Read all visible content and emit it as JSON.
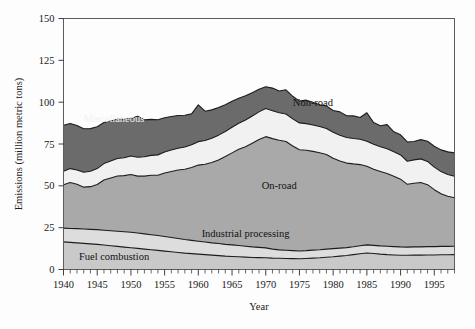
{
  "chart_data": {
    "type": "area",
    "stacked": true,
    "title": "",
    "xlabel": "Year",
    "ylabel": "Emissions (million metric tons)",
    "xlim": [
      1940,
      1998
    ],
    "ylim": [
      0,
      150
    ],
    "yticks": [
      0,
      25,
      50,
      75,
      100,
      125,
      150
    ],
    "xticks": [
      1940,
      1945,
      1950,
      1955,
      1960,
      1965,
      1970,
      1975,
      1980,
      1985,
      1990,
      1995
    ],
    "xtick_minor_step": 1,
    "grid": false,
    "legend": "inline-labels",
    "x": [
      1940,
      1941,
      1942,
      1943,
      1944,
      1945,
      1946,
      1947,
      1948,
      1949,
      1950,
      1951,
      1952,
      1953,
      1954,
      1955,
      1956,
      1957,
      1958,
      1959,
      1960,
      1961,
      1962,
      1963,
      1964,
      1965,
      1966,
      1967,
      1968,
      1969,
      1970,
      1971,
      1972,
      1973,
      1974,
      1975,
      1976,
      1977,
      1978,
      1979,
      1980,
      1981,
      1982,
      1983,
      1984,
      1985,
      1986,
      1987,
      1988,
      1989,
      1990,
      1991,
      1992,
      1993,
      1994,
      1995,
      1996,
      1997,
      1998
    ],
    "series": [
      {
        "name": "Fuel combustion",
        "color": "#c9c9c9",
        "values": [
          16.5,
          16.2,
          15.9,
          15.6,
          15.3,
          15.0,
          14.6,
          14.2,
          13.8,
          13.4,
          13.0,
          12.6,
          12.2,
          11.8,
          11.4,
          11.0,
          10.6,
          10.2,
          9.8,
          9.5,
          9.2,
          8.9,
          8.6,
          8.3,
          8.0,
          7.8,
          7.6,
          7.4,
          7.2,
          7.1,
          7.0,
          6.8,
          6.7,
          6.6,
          6.5,
          6.4,
          6.6,
          6.8,
          7.0,
          7.3,
          7.6,
          8.0,
          8.4,
          8.9,
          9.4,
          9.9,
          9.6,
          9.2,
          8.9,
          8.7,
          8.5,
          8.5,
          8.6,
          8.6,
          8.7,
          8.7,
          8.8,
          8.8,
          8.9
        ]
      },
      {
        "name": "Industrial processing",
        "color": "#dddddd",
        "values": [
          8.2,
          8.3,
          8.5,
          8.6,
          8.7,
          8.8,
          8.9,
          9.0,
          9.1,
          9.2,
          9.3,
          9.2,
          9.1,
          9.0,
          8.9,
          8.7,
          8.5,
          8.3,
          8.1,
          7.9,
          7.7,
          7.5,
          7.3,
          7.2,
          7.0,
          6.9,
          6.7,
          6.5,
          6.3,
          6.1,
          5.9,
          5.4,
          5.0,
          4.9,
          4.8,
          4.7,
          4.7,
          4.8,
          4.8,
          4.9,
          4.9,
          4.8,
          4.7,
          4.7,
          4.8,
          4.8,
          4.8,
          4.9,
          5.0,
          5.0,
          5.0,
          4.9,
          4.9,
          4.9,
          5.0,
          5.0,
          5.0,
          5.0,
          5.0
        ]
      },
      {
        "name": "On-road",
        "color": "#a9a9a9",
        "values": [
          26.0,
          27.5,
          26.5,
          25.0,
          25.5,
          27.0,
          30.0,
          31.5,
          33.0,
          33.5,
          34.5,
          34.0,
          34.5,
          35.5,
          36.0,
          38.0,
          39.5,
          41.0,
          42.0,
          43.5,
          45.5,
          46.5,
          48.0,
          50.0,
          52.5,
          55.0,
          57.5,
          59.5,
          62.0,
          64.5,
          66.5,
          66.0,
          65.5,
          65.0,
          62.5,
          60.5,
          60.0,
          59.0,
          58.0,
          56.5,
          54.0,
          52.0,
          50.5,
          49.5,
          48.5,
          47.0,
          45.5,
          44.5,
          43.5,
          42.0,
          40.5,
          37.5,
          38.0,
          38.5,
          37.0,
          34.0,
          31.5,
          30.0,
          29.0
        ]
      },
      {
        "name": "Non-road",
        "color": "#f1f1f1",
        "values": [
          8.0,
          8.3,
          8.6,
          8.9,
          9.2,
          9.5,
          9.8,
          10.1,
          10.4,
          10.7,
          11.0,
          11.3,
          11.6,
          11.9,
          12.2,
          12.5,
          12.8,
          13.0,
          13.3,
          13.6,
          14.0,
          14.2,
          14.5,
          14.8,
          15.0,
          15.3,
          15.6,
          15.9,
          16.2,
          16.5,
          16.8,
          16.7,
          16.5,
          16.4,
          16.2,
          16.0,
          15.9,
          15.8,
          15.7,
          15.6,
          15.5,
          15.4,
          15.3,
          15.2,
          15.1,
          15.0,
          14.9,
          14.8,
          14.7,
          14.6,
          14.5,
          13.8,
          14.0,
          14.1,
          13.9,
          13.5,
          13.2,
          13.0,
          12.8
        ]
      },
      {
        "name": "Miscellaneous",
        "color": "#6b6b6b",
        "values": [
          27.5,
          27.0,
          26.5,
          26.0,
          25.5,
          25.0,
          24.5,
          24.0,
          23.5,
          23.0,
          22.5,
          24.5,
          22.0,
          21.5,
          21.0,
          20.5,
          20.0,
          19.5,
          19.0,
          18.5,
          22.0,
          17.5,
          17.0,
          16.5,
          16.0,
          15.5,
          15.0,
          14.5,
          14.0,
          13.5,
          13.0,
          13.5,
          13.0,
          14.5,
          13.5,
          13.0,
          14.0,
          13.5,
          13.0,
          13.5,
          13.0,
          14.0,
          13.0,
          13.5,
          13.0,
          17.0,
          13.0,
          12.5,
          14.5,
          12.0,
          12.0,
          11.5,
          11.0,
          11.5,
          12.0,
          12.5,
          13.0,
          13.5,
          14.0
        ]
      }
    ],
    "annotations": [
      {
        "text": "Miscellaneous",
        "x": 1947.5,
        "y": 88.0,
        "style": "light"
      },
      {
        "text": "Non-road",
        "x": 1977.0,
        "y": 98.0,
        "style": "dark"
      },
      {
        "text": "On-road",
        "x": 1972.0,
        "y": 48.0,
        "style": "dark"
      },
      {
        "text": "Industrial processing",
        "x": 1967.0,
        "y": 19.5,
        "style": "dark"
      },
      {
        "text": "Fuel combustion",
        "x": 1947.5,
        "y": 5.5,
        "style": "dark"
      }
    ]
  },
  "axes": {
    "ylabel": "Emissions (million metric tons)",
    "xlabel": "Year",
    "ytick_labels": [
      "0",
      "25",
      "50",
      "75",
      "100",
      "125",
      "150"
    ],
    "xtick_labels": [
      "1940",
      "1945",
      "1950",
      "1955",
      "1960",
      "1965",
      "1970",
      "1975",
      "1980",
      "1985",
      "1990",
      "1995"
    ]
  },
  "colors": {
    "fuel_combustion": "#c9c9c9",
    "industrial_processing": "#dddddd",
    "on_road": "#a9a9a9",
    "non_road": "#f1f1f1",
    "miscellaneous": "#6b6b6b",
    "axis": "#5c5c5c",
    "text": "#1a1a1a",
    "background": "#fdfdfd"
  }
}
